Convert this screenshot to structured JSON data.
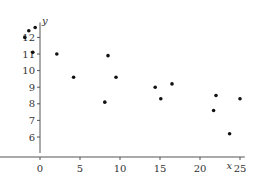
{
  "chart_data": {
    "type": "scatter",
    "title": "",
    "xlabel": "x",
    "ylabel": "y",
    "xlim": [
      -3,
      25
    ],
    "ylim": [
      5.2,
      13
    ],
    "xticks": [
      0,
      5,
      10,
      15,
      20,
      25
    ],
    "yticks": [
      6,
      7,
      8,
      9,
      10,
      11,
      12
    ],
    "grid": false,
    "legend": null,
    "points": [
      {
        "x": -1.9,
        "y": 12.0
      },
      {
        "x": -1.4,
        "y": 12.4
      },
      {
        "x": -0.6,
        "y": 12.6
      },
      {
        "x": -0.9,
        "y": 11.1
      },
      {
        "x": 2.1,
        "y": 11.0
      },
      {
        "x": 4.2,
        "y": 9.6
      },
      {
        "x": 8.5,
        "y": 10.9
      },
      {
        "x": 9.5,
        "y": 9.6
      },
      {
        "x": 8.1,
        "y": 8.1
      },
      {
        "x": 14.4,
        "y": 9.0
      },
      {
        "x": 15.1,
        "y": 8.3
      },
      {
        "x": 16.5,
        "y": 9.2
      },
      {
        "x": 22.0,
        "y": 8.5
      },
      {
        "x": 21.7,
        "y": 7.6
      },
      {
        "x": 25.0,
        "y": 8.3
      },
      {
        "x": 23.7,
        "y": 6.2
      }
    ]
  },
  "layout": {
    "origin_px": {
      "x": 40,
      "y": 170
    },
    "x_scale": 8,
    "y_scale": 16.6,
    "x_axis_y": 157,
    "x_axis_from": -5,
    "x_axis_to": 25.6,
    "y_axis_from": 5.2,
    "y_axis_to": 12.9,
    "point_radius": 1.8,
    "colors": {
      "axis": "#555555",
      "point": "#111111",
      "text": "#333333"
    }
  },
  "labels": {
    "x_axis": "x",
    "y_axis": "y"
  }
}
